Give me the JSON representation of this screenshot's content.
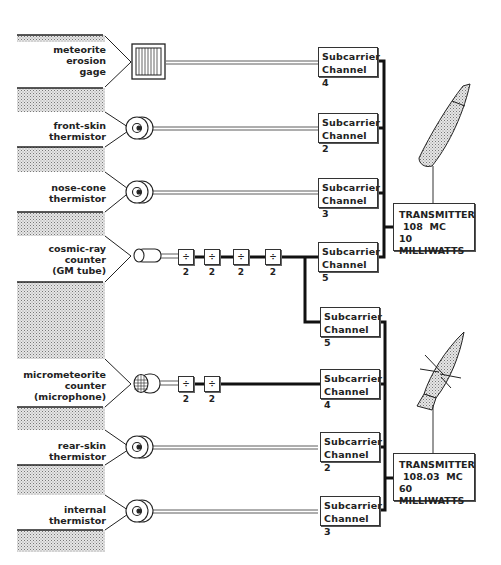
{
  "sensors": [
    {
      "id": "meteorite-erosion-gage",
      "lines": [
        "meteorite",
        "erosion",
        "gage"
      ],
      "icon": "gage-icon"
    },
    {
      "id": "front-skin-thermistor",
      "lines": [
        "front-skin",
        "thermistor"
      ],
      "icon": "thermistor-icon"
    },
    {
      "id": "nose-cone-thermistor",
      "lines": [
        "nose-cone",
        "thermistor"
      ],
      "icon": "thermistor-icon"
    },
    {
      "id": "cosmic-ray-counter",
      "lines": [
        "cosmic-ray",
        "counter",
        "(GM tube)"
      ],
      "icon": "gm-tube-icon"
    },
    {
      "id": "micrometeorite-counter",
      "lines": [
        "micrometeorite",
        "counter",
        "(microphone)"
      ],
      "icon": "microphone-icon"
    },
    {
      "id": "rear-skin-thermistor",
      "lines": [
        "rear-skin",
        "thermistor"
      ],
      "icon": "thermistor-icon"
    },
    {
      "id": "internal-thermistor",
      "lines": [
        "internal",
        "thermistor"
      ],
      "icon": "thermistor-icon"
    }
  ],
  "subcarriers": [
    {
      "line1": "Subcarrier",
      "line2": "Channel 4"
    },
    {
      "line1": "Subcarrier",
      "line2": "Channel 2"
    },
    {
      "line1": "Subcarrier",
      "line2": "Channel 3"
    },
    {
      "line1": "Subcarrier",
      "line2": "Channel 5"
    },
    {
      "line1": "Subcarrier",
      "line2": "Channel 5"
    },
    {
      "line1": "Subcarrier",
      "line2": "Channel 4"
    },
    {
      "line1": "Subcarrier",
      "line2": "Channel 2"
    },
    {
      "line1": "Subcarrier",
      "line2": "Channel 3"
    }
  ],
  "dividers": {
    "label": "÷ 2",
    "cosmic_ray_count": 4,
    "micrometeorite_count": 2
  },
  "transmitters": [
    {
      "line1": "TRANSMITTER",
      "line2": "108  MC",
      "line3": "10 MILLIWATTS"
    },
    {
      "line1": "TRANSMITTER",
      "line2": "108.03  MC",
      "line3": "60 MILLIWATTS"
    }
  ],
  "colors": {
    "line": "#1a1a1a",
    "stipple": "#9a9a9a",
    "background": "#ffffff"
  }
}
